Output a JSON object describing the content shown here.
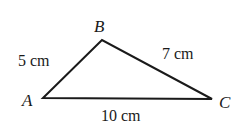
{
  "figure": {
    "type": "triangle",
    "vertices": [
      {
        "label": "A",
        "x": 43,
        "y": 98
      },
      {
        "label": "B",
        "x": 102,
        "y": 40
      },
      {
        "label": "C",
        "x": 212,
        "y": 99
      }
    ],
    "sides": {
      "AB": "5 cm",
      "BC": "7 cm",
      "AC": "10 cm"
    },
    "stroke_color": "#1a1a1a"
  }
}
